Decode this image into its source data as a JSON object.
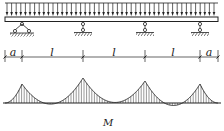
{
  "diagram": {
    "dimensions": [
      {
        "label": "a",
        "from": 5,
        "to": 22
      },
      {
        "label": "l",
        "from": 22,
        "to": 83
      },
      {
        "label": "l",
        "from": 83,
        "to": 145
      },
      {
        "label": "l",
        "from": 145,
        "to": 200
      },
      {
        "label": "a",
        "from": 200,
        "to": 218
      }
    ],
    "supports": [
      {
        "type": "pin",
        "x": 22
      },
      {
        "type": "roller",
        "x": 83
      },
      {
        "type": "roller",
        "x": 145
      },
      {
        "type": "roller",
        "x": 200
      }
    ],
    "moment_label": "M",
    "load": "uniformly distributed load"
  }
}
